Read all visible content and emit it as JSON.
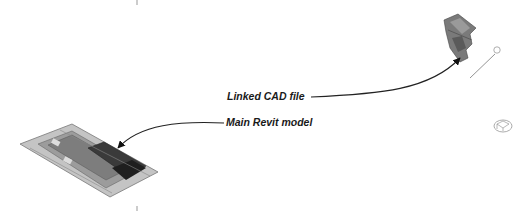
{
  "annotations": {
    "linked_cad": "Linked CAD file",
    "main_model": "Main Revit model"
  },
  "colors": {
    "background": "#ffffff",
    "text": "#1a1a1a",
    "leader": "#222222",
    "site_light": "#b8b8b8",
    "site_mid": "#8a8a8a",
    "building_dark": "#2e2e2e"
  },
  "icons": [
    "revit-model-site-icon",
    "linked-cad-site-icon",
    "survey-point-icon",
    "viewcube-icon"
  ]
}
